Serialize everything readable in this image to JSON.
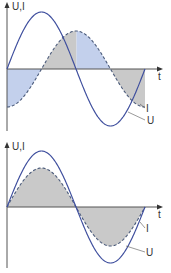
{
  "diagrams": [
    {
      "name": "phase-shifted",
      "axis_label_y": "U,I",
      "axis_label_x": "t",
      "curve_labels": {
        "current": "I",
        "voltage": "U"
      },
      "phase_shift_deg": 90,
      "description": "Voltage U (solid) and current I (dashed) with 90° phase shift; alternating blue and gray shaded power areas"
    },
    {
      "name": "in-phase",
      "axis_label_y": "U,I",
      "axis_label_x": "t",
      "curve_labels": {
        "current": "I",
        "voltage": "U"
      },
      "phase_shift_deg": 0,
      "description": "Voltage U (solid) and current I (dashed) in phase; gray shaded areas"
    }
  ],
  "colors": {
    "voltage_curve": "#3f4f9e",
    "current_curve": "#4a5a7a",
    "fill_gray": "#c9c9c9",
    "fill_blue": "#c3d0ec",
    "axis": "#555555"
  }
}
